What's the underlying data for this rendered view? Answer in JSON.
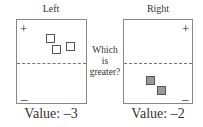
{
  "left": {
    "title": "Left",
    "plus": "+",
    "minus": "–",
    "value_label": "Value: –3",
    "squares": "hollow",
    "square_count": 3
  },
  "right": {
    "title": "Right",
    "plus": "+",
    "minus": "–",
    "value_label": "Value: –2",
    "squares": "filled",
    "square_count": 2
  },
  "question": {
    "line1": "Which",
    "line2": "is",
    "line3": "greater?"
  },
  "colors": {
    "border": "#888888",
    "filled_square": "#999999",
    "dashed_line": "#777777"
  }
}
